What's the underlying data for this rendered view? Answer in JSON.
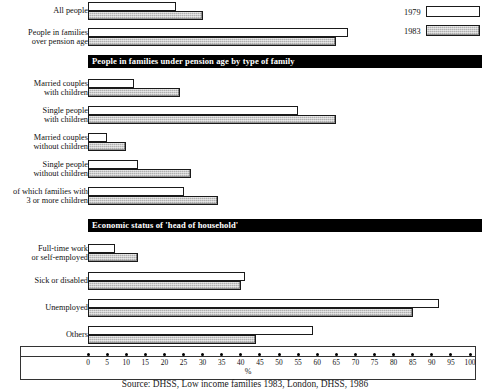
{
  "legend": {
    "items": [
      {
        "label": "1979",
        "swatch": "white-outline"
      },
      {
        "label": "1983",
        "swatch": "grey-hatched"
      }
    ]
  },
  "axis": {
    "unit_label": "%",
    "ticks": [
      "0",
      "5",
      "10",
      "15",
      "20",
      "25",
      "30",
      "35",
      "40",
      "45",
      "50",
      "55",
      "60",
      "65",
      "70",
      "75",
      "80",
      "85",
      "90",
      "95",
      "100"
    ]
  },
  "source": {
    "text": "Source: DHSS, Low income families 1983, London, DHSS, 1986"
  },
  "sections": [
    {
      "id": "section-families-under-pension-age",
      "title": "People in families under pension age by type of family"
    },
    {
      "id": "section-economic-status",
      "title": "Economic status of 'head of household'"
    }
  ],
  "chart_data": {
    "type": "bar",
    "orientation": "horizontal",
    "title": "",
    "xlabel": "%",
    "ylabel": "",
    "xlim": [
      0,
      100
    ],
    "xticks": [
      0,
      5,
      10,
      15,
      20,
      25,
      30,
      35,
      40,
      45,
      50,
      55,
      60,
      65,
      70,
      75,
      80,
      85,
      90,
      95,
      100
    ],
    "grid": false,
    "legend_position": "top-right",
    "categories": [
      "All people",
      "People in families\nover pension age",
      "Married couples\nwith children",
      "Single people\nwith children",
      "Married couples\nwithout children",
      "Single people\nwithout children",
      "of which families with\n3 or more children",
      "Full-time work\nor self-employed",
      "Sick or disabled",
      "Unemployed",
      "Others"
    ],
    "series": [
      {
        "name": "1979",
        "values": [
          23,
          68,
          12,
          55,
          5,
          13,
          25,
          7,
          41,
          92,
          59
        ]
      },
      {
        "name": "1983",
        "values": [
          30,
          65,
          24,
          65,
          10,
          27,
          34,
          13,
          40,
          85,
          44
        ]
      }
    ]
  },
  "rows": [
    {
      "name": "row-all-people",
      "label": "All people",
      "y": 2,
      "v1979": 23,
      "v1983": 30
    },
    {
      "name": "row-families-over-pension-age",
      "label": "People in families\nover pension age",
      "y": 28,
      "v1979": 68,
      "v1983": 65
    },
    {
      "name": "row-married-couples-with-children",
      "label": "Married couples\nwith children",
      "y": 79,
      "v1979": 12,
      "v1983": 24
    },
    {
      "name": "row-single-people-with-children",
      "label": "Single people\nwith children",
      "y": 106,
      "v1979": 55,
      "v1983": 65
    },
    {
      "name": "row-married-couples-without-children",
      "label": "Married couples\nwithout children",
      "y": 133,
      "v1979": 5,
      "v1983": 10
    },
    {
      "name": "row-single-people-without-children",
      "label": "Single people\nwithout children",
      "y": 160,
      "v1979": 13,
      "v1983": 27
    },
    {
      "name": "row-three-or-more-children",
      "label": "of which families with\n3 or more children",
      "y": 187,
      "v1979": 25,
      "v1983": 34
    },
    {
      "name": "row-full-time-work",
      "label": "Full-time work\nor self-employed",
      "y": 244,
      "v1979": 7,
      "v1983": 13
    },
    {
      "name": "row-sick-or-disabled",
      "label": "Sick or disabled",
      "y": 272,
      "v1979": 41,
      "v1983": 40
    },
    {
      "name": "row-unemployed",
      "label": "Unemployed",
      "y": 299,
      "v1979": 92,
      "v1983": 85
    },
    {
      "name": "row-others",
      "label": "Others",
      "y": 326,
      "v1979": 59,
      "v1983": 44
    }
  ],
  "banner_positions": {
    "section1_y": 55,
    "section2_y": 219
  }
}
